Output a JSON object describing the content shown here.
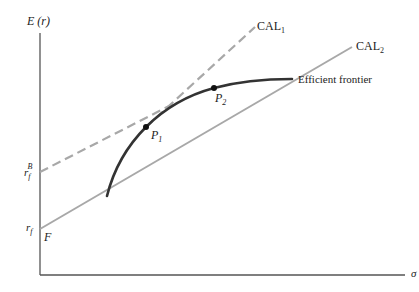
{
  "axes": {
    "y_label": "E (r)",
    "x_label": "σ"
  },
  "labels": {
    "rf": "r",
    "rf_sub": "f",
    "rfB": "r",
    "rfB_sub": "f",
    "rfB_sup": "B",
    "F": "F",
    "P1": "P",
    "P1_sub": "1",
    "P2": "P",
    "P2_sub": "2",
    "cal1": "CAL",
    "cal1_sub": "1",
    "cal2": "CAL",
    "cal2_sub": "2",
    "frontier": "Efficient frontier"
  },
  "colors": {
    "axis": "#555555",
    "frontier": "#333333",
    "cal": "#a8a8a8",
    "point": "#111111"
  }
}
